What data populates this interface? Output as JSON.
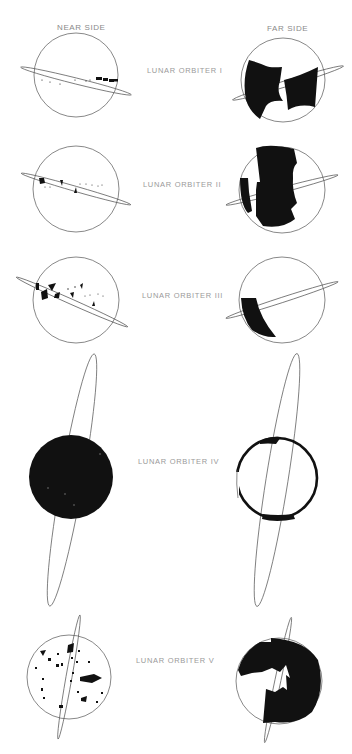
{
  "headers": {
    "near": "NEAR SIDE",
    "far": "FAR SIDE"
  },
  "orbiters": [
    {
      "label": "LUNAR ORBITER I"
    },
    {
      "label": "LUNAR ORBITER II"
    },
    {
      "label": "LUNAR ORBITER III"
    },
    {
      "label": "LUNAR ORBITER IV"
    },
    {
      "label": "LUNAR ORBITER V"
    }
  ],
  "colors": {
    "ink": "#111111",
    "outline": "#555555",
    "label": "#9a9a9a"
  }
}
